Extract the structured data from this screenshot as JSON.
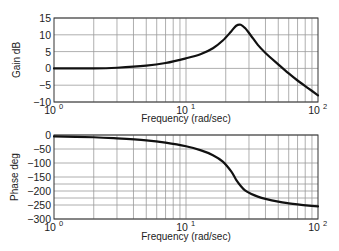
{
  "chart_data": [
    {
      "type": "line",
      "title": "",
      "xlabel": "Frequency (rad/sec)",
      "ylabel": "Gain dB",
      "xscale": "log",
      "xlim": [
        1,
        100
      ],
      "ylim": [
        -10,
        15
      ],
      "grid": true,
      "yticks": [
        "15",
        "10",
        "5",
        "0",
        "−5",
        "−10"
      ],
      "ytick_values": [
        15,
        10,
        5,
        0,
        -5,
        -10
      ],
      "xticks": [
        {
          "base": "10",
          "exp": "0"
        },
        {
          "base": "10",
          "exp": "1"
        },
        {
          "base": "10",
          "exp": "2"
        }
      ],
      "xtick_values": [
        1,
        10,
        100
      ],
      "series": [
        {
          "name": "Gain",
          "x": [
            1,
            2,
            3,
            5,
            7,
            10,
            13,
            16,
            19,
            22,
            24,
            26,
            28,
            31,
            35,
            40,
            50,
            60,
            70,
            85,
            100
          ],
          "y": [
            0,
            0,
            0.2,
            0.8,
            1.6,
            3,
            4.3,
            6,
            8.3,
            11,
            12.7,
            13,
            12,
            9.8,
            7,
            4.6,
            1.2,
            -1.5,
            -3.6,
            -6,
            -8
          ]
        }
      ]
    },
    {
      "type": "line",
      "title": "",
      "xlabel": "Frequency (rad/sec)",
      "ylabel": "Phase deg",
      "xscale": "log",
      "xlim": [
        1,
        100
      ],
      "ylim": [
        -300,
        0
      ],
      "grid": true,
      "yticks": [
        "0",
        "−50",
        "−100",
        "−150",
        "−200",
        "−250",
        "−300"
      ],
      "ytick_values": [
        0,
        -50,
        -100,
        -150,
        -200,
        -250,
        -300
      ],
      "xticks": [
        {
          "base": "10",
          "exp": "0"
        },
        {
          "base": "10",
          "exp": "1"
        },
        {
          "base": "10",
          "exp": "2"
        }
      ],
      "xtick_values": [
        1,
        10,
        100
      ],
      "series": [
        {
          "name": "Phase",
          "x": [
            1,
            2,
            3,
            5,
            7,
            10,
            13,
            16,
            19,
            22,
            24,
            26,
            28,
            31,
            35,
            40,
            50,
            60,
            70,
            85,
            100
          ],
          "y": [
            -5,
            -8,
            -12,
            -19,
            -27,
            -40,
            -55,
            -72,
            -95,
            -130,
            -160,
            -182,
            -198,
            -210,
            -220,
            -228,
            -238,
            -244,
            -248,
            -252,
            -255
          ]
        }
      ]
    }
  ]
}
